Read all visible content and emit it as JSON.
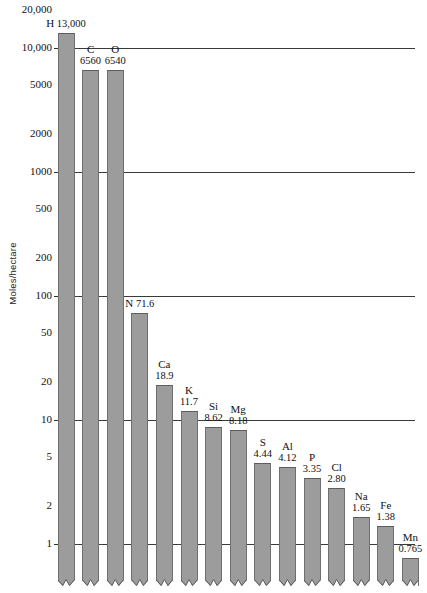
{
  "chart_data": {
    "type": "bar",
    "title": "",
    "xlabel": "",
    "ylabel": "Moles/hectare",
    "scale": "log",
    "ylim": [
      1,
      20000
    ],
    "grid": true,
    "legend": "none",
    "ytick_labels": [
      "20,000",
      "10,000",
      "5000",
      "2000",
      "1000",
      "500",
      "200",
      "100",
      "50",
      "20",
      "10",
      "5",
      "2",
      "1"
    ],
    "ytick_values": [
      20000,
      10000,
      5000,
      2000,
      1000,
      500,
      200,
      100,
      50,
      20,
      10,
      5,
      2,
      1
    ],
    "gridline_values": [
      10000,
      1000,
      100,
      10,
      1
    ],
    "categories": [
      "H",
      "C",
      "O",
      "N",
      "Ca",
      "K",
      "Si",
      "Mg",
      "S",
      "Al",
      "P",
      "Cl",
      "Na",
      "Fe",
      "Mn"
    ],
    "values": [
      13000,
      6560,
      6540,
      71.6,
      18.9,
      11.7,
      8.62,
      8.18,
      4.44,
      4.12,
      3.35,
      2.8,
      1.65,
      1.38,
      0.765
    ],
    "value_labels": [
      "13,000",
      "6560",
      "6540",
      "71.6",
      "18.9",
      "11.7",
      "8.62",
      "8.18",
      "4.44",
      "4.12",
      "3.35",
      "2.80",
      "1.65",
      "1.38",
      "0.765"
    ],
    "bar_color": "#9c9c9c",
    "bars": [
      {
        "symbol": "H",
        "value_label": "13,000",
        "inline": true
      },
      {
        "symbol": "C",
        "value_label": "6560",
        "inline": false
      },
      {
        "symbol": "O",
        "value_label": "6540",
        "inline": false
      },
      {
        "symbol": "N",
        "value_label": "71.6",
        "inline": true
      },
      {
        "symbol": "Ca",
        "value_label": "18.9",
        "inline": false
      },
      {
        "symbol": "K",
        "value_label": "11.7",
        "inline": false
      },
      {
        "symbol": "Si",
        "value_label": "8.62",
        "inline": false
      },
      {
        "symbol": "Mg",
        "value_label": "8.18",
        "inline": false
      },
      {
        "symbol": "S",
        "value_label": "4.44",
        "inline": false
      },
      {
        "symbol": "Al",
        "value_label": "4.12",
        "inline": false
      },
      {
        "symbol": "P",
        "value_label": "3.35",
        "inline": false
      },
      {
        "symbol": "Cl",
        "value_label": "2.80",
        "inline": false
      },
      {
        "symbol": "Na",
        "value_label": "1.65",
        "inline": false
      },
      {
        "symbol": "Fe",
        "value_label": "1.38",
        "inline": false
      },
      {
        "symbol": "Mn",
        "value_label": "0.765",
        "inline": false
      }
    ]
  }
}
